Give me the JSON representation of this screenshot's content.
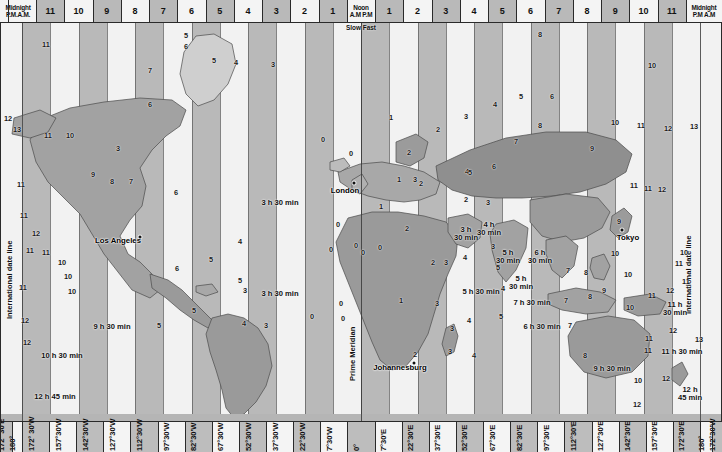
{
  "map": {
    "title": "World Time Zone Map",
    "width": 722,
    "height": 452,
    "colors": {
      "band_dark": "#b9b9b9",
      "band_light": "#f2f2f2",
      "land_dark": "#8f8f8f",
      "land_mid": "#a8a8a8",
      "land_light": "#cfcfcf",
      "ocean": "#e9e9e9",
      "ink": "#2a2a2a"
    }
  },
  "top_axis": {
    "label_left_l1": "Midnight",
    "label_left_l2": "P.M.A.M.",
    "label_center_l1": "Noon",
    "label_center_l2": "A.M P.M",
    "label_center_l3": "Slow Fast",
    "label_right_l1": "Midnight",
    "label_right_l2": "P.M A.M",
    "hours": [
      "11",
      "10",
      "9",
      "8",
      "7",
      "6",
      "5",
      "4",
      "3",
      "2",
      "1",
      "1",
      "2",
      "3",
      "4",
      "5",
      "6",
      "7",
      "8",
      "9",
      "10",
      "11"
    ]
  },
  "bottom_axis": {
    "longitudes": [
      "172° 30'E",
      "180°",
      "172° 30'W",
      "157°30'W",
      "142°30'W",
      "127°30'W",
      "112°30'W",
      "97°30'W",
      "82°30'W",
      "67°30'W",
      "52°30'W",
      "37°30'W",
      "22°30'W",
      "7°30'W",
      "0°",
      "7°30'E",
      "22°30'E",
      "37°30'E",
      "52°30'E",
      "67°30'E",
      "82°30'E",
      "97°30'E",
      "112°30'E",
      "127°30'E",
      "142°30'E",
      "157°30'E",
      "172°30'E",
      "180°",
      "172°30'W"
    ]
  },
  "vertical_labels": {
    "date_line_left": "International date line",
    "date_line_right": "International date line",
    "prime_meridian": "Prime Meridian"
  },
  "cities": [
    {
      "name": "Los Angeles",
      "x": 118,
      "y": 240,
      "dot_x": 140,
      "dot_y": 237
    },
    {
      "name": "London",
      "x": 345,
      "y": 190,
      "dot_x": 354,
      "dot_y": 183
    },
    {
      "name": "Tokyo",
      "x": 628,
      "y": 237,
      "dot_x": 622,
      "dot_y": 230
    },
    {
      "name": "Johannesburg",
      "x": 400,
      "y": 367,
      "dot_x": 414,
      "dot_y": 363
    }
  ],
  "half_hour_notes": [
    {
      "label": "3 h 30 min",
      "x": 280,
      "y": 203
    },
    {
      "label": "3 h 30 min",
      "x": 280,
      "y": 294
    },
    {
      "label": "3 h\n30 min",
      "x": 466,
      "y": 234
    },
    {
      "label": "4 h\n30 min",
      "x": 489,
      "y": 229
    },
    {
      "label": "5 h\n30 min",
      "x": 508,
      "y": 257
    },
    {
      "label": "6 h\n30 min",
      "x": 540,
      "y": 257
    },
    {
      "label": "5 h\n30 min",
      "x": 521,
      "y": 283
    },
    {
      "label": "5 h 30 min",
      "x": 481,
      "y": 292
    },
    {
      "label": "7 h 30 min",
      "x": 532,
      "y": 303
    },
    {
      "label": "6 h 30 min",
      "x": 542,
      "y": 327
    },
    {
      "label": "9 h 30 min",
      "x": 112,
      "y": 327
    },
    {
      "label": "10 h 30 min",
      "x": 62,
      "y": 356
    },
    {
      "label": "12 h 45 min",
      "x": 55,
      "y": 397
    },
    {
      "label": "9 h 30 min",
      "x": 612,
      "y": 369
    },
    {
      "label": "11 h 30 min",
      "x": 682,
      "y": 352
    },
    {
      "label": "11 h\n30 min",
      "x": 675,
      "y": 309
    },
    {
      "label": "12 h\n45 min",
      "x": 690,
      "y": 394
    }
  ],
  "zone_numbers": [
    {
      "t": "12",
      "x": 8,
      "y": 118
    },
    {
      "t": "13",
      "x": 17,
      "y": 129
    },
    {
      "t": "11",
      "x": 48,
      "y": 135
    },
    {
      "t": "10",
      "x": 70,
      "y": 135
    },
    {
      "t": "11",
      "x": 21,
      "y": 184
    },
    {
      "t": "9",
      "x": 93,
      "y": 174
    },
    {
      "t": "8",
      "x": 112,
      "y": 181
    },
    {
      "t": "7",
      "x": 131,
      "y": 181
    },
    {
      "t": "6",
      "x": 176,
      "y": 192
    },
    {
      "t": "7",
      "x": 150,
      "y": 70
    },
    {
      "t": "6",
      "x": 186,
      "y": 46
    },
    {
      "t": "5",
      "x": 214,
      "y": 60
    },
    {
      "t": "4",
      "x": 236,
      "y": 62
    },
    {
      "t": "3",
      "x": 273,
      "y": 64
    },
    {
      "t": "4",
      "x": 240,
      "y": 241
    },
    {
      "t": "5",
      "x": 211,
      "y": 259
    },
    {
      "t": "6",
      "x": 177,
      "y": 268
    },
    {
      "t": "5",
      "x": 240,
      "y": 280
    },
    {
      "t": "3",
      "x": 245,
      "y": 290
    },
    {
      "t": "4",
      "x": 244,
      "y": 323
    },
    {
      "t": "3",
      "x": 266,
      "y": 325
    },
    {
      "t": "5",
      "x": 194,
      "y": 310
    },
    {
      "t": "11",
      "x": 30,
      "y": 250
    },
    {
      "t": "11",
      "x": 46,
      "y": 252
    },
    {
      "t": "10",
      "x": 62,
      "y": 262
    },
    {
      "t": "10",
      "x": 68,
      "y": 276
    },
    {
      "t": "10",
      "x": 72,
      "y": 291
    },
    {
      "t": "11",
      "x": 23,
      "y": 287
    },
    {
      "t": "12",
      "x": 36,
      "y": 233
    },
    {
      "t": "12",
      "x": 27,
      "y": 342
    },
    {
      "t": "12",
      "x": 25,
      "y": 320
    },
    {
      "t": "11",
      "x": 24,
      "y": 215
    },
    {
      "t": "0",
      "x": 323,
      "y": 139
    },
    {
      "t": "0",
      "x": 351,
      "y": 153
    },
    {
      "t": "0",
      "x": 338,
      "y": 224
    },
    {
      "t": "0",
      "x": 356,
      "y": 245
    },
    {
      "t": "0",
      "x": 331,
      "y": 249
    },
    {
      "t": "0",
      "x": 363,
      "y": 252
    },
    {
      "t": "0",
      "x": 380,
      "y": 247
    },
    {
      "t": "0",
      "x": 341,
      "y": 303
    },
    {
      "t": "0",
      "x": 343,
      "y": 318
    },
    {
      "t": "1",
      "x": 399,
      "y": 179
    },
    {
      "t": "2",
      "x": 421,
      "y": 183
    },
    {
      "t": "3",
      "x": 415,
      "y": 179
    },
    {
      "t": "2",
      "x": 407,
      "y": 228
    },
    {
      "t": "2",
      "x": 466,
      "y": 199
    },
    {
      "t": "3",
      "x": 488,
      "y": 202
    },
    {
      "t": "4",
      "x": 467,
      "y": 171
    },
    {
      "t": "5",
      "x": 470,
      "y": 172
    },
    {
      "t": "6",
      "x": 494,
      "y": 166
    },
    {
      "t": "7",
      "x": 516,
      "y": 141
    },
    {
      "t": "8",
      "x": 540,
      "y": 125
    },
    {
      "t": "8",
      "x": 540,
      "y": 34
    },
    {
      "t": "9",
      "x": 592,
      "y": 148
    },
    {
      "t": "10",
      "x": 615,
      "y": 122
    },
    {
      "t": "11",
      "x": 641,
      "y": 125
    },
    {
      "t": "12",
      "x": 668,
      "y": 128
    },
    {
      "t": "13",
      "x": 694,
      "y": 126
    },
    {
      "t": "10",
      "x": 652,
      "y": 65
    },
    {
      "t": "11",
      "x": 46,
      "y": 44
    },
    {
      "t": "11",
      "x": 634,
      "y": 185
    },
    {
      "t": "11",
      "x": 648,
      "y": 188
    },
    {
      "t": "12",
      "x": 662,
      "y": 189
    },
    {
      "t": "9",
      "x": 619,
      "y": 221
    },
    {
      "t": "10",
      "x": 615,
      "y": 253
    },
    {
      "t": "10",
      "x": 628,
      "y": 274
    },
    {
      "t": "9",
      "x": 604,
      "y": 290
    },
    {
      "t": "10",
      "x": 630,
      "y": 307
    },
    {
      "t": "11",
      "x": 652,
      "y": 295
    },
    {
      "t": "12",
      "x": 670,
      "y": 290
    },
    {
      "t": "11",
      "x": 679,
      "y": 263
    },
    {
      "t": "10",
      "x": 684,
      "y": 252
    },
    {
      "t": "11",
      "x": 686,
      "y": 281
    },
    {
      "t": "12",
      "x": 673,
      "y": 330
    },
    {
      "t": "13",
      "x": 699,
      "y": 339
    },
    {
      "t": "11",
      "x": 649,
      "y": 338
    },
    {
      "t": "10",
      "x": 638,
      "y": 380
    },
    {
      "t": "12",
      "x": 666,
      "y": 378
    },
    {
      "t": "11",
      "x": 648,
      "y": 350
    },
    {
      "t": "12",
      "x": 637,
      "y": 404
    },
    {
      "t": "7",
      "x": 568,
      "y": 270
    },
    {
      "t": "8",
      "x": 586,
      "y": 272
    },
    {
      "t": "7",
      "x": 566,
      "y": 300
    },
    {
      "t": "8",
      "x": 590,
      "y": 296
    },
    {
      "t": "7",
      "x": 570,
      "y": 325
    },
    {
      "t": "8",
      "x": 585,
      "y": 355
    },
    {
      "t": "4",
      "x": 469,
      "y": 320
    },
    {
      "t": "3",
      "x": 452,
      "y": 328
    },
    {
      "t": "3",
      "x": 437,
      "y": 303
    },
    {
      "t": "3",
      "x": 450,
      "y": 351
    },
    {
      "t": "2",
      "x": 415,
      "y": 354
    },
    {
      "t": "1",
      "x": 401,
      "y": 300
    },
    {
      "t": "4",
      "x": 474,
      "y": 355
    },
    {
      "t": "2",
      "x": 433,
      "y": 262
    },
    {
      "t": "4",
      "x": 465,
      "y": 257
    },
    {
      "t": "3",
      "x": 446,
      "y": 262
    },
    {
      "t": "3",
      "x": 493,
      "y": 246
    },
    {
      "t": "4",
      "x": 503,
      "y": 288
    },
    {
      "t": "5",
      "x": 501,
      "y": 316
    },
    {
      "t": "1",
      "x": 381,
      "y": 206
    },
    {
      "t": "5",
      "x": 498,
      "y": 267
    },
    {
      "t": "1",
      "x": 391,
      "y": 117
    },
    {
      "t": "2",
      "x": 438,
      "y": 129
    },
    {
      "t": "3",
      "x": 466,
      "y": 116
    },
    {
      "t": "4",
      "x": 495,
      "y": 104
    },
    {
      "t": "5",
      "x": 521,
      "y": 96
    },
    {
      "t": "6",
      "x": 552,
      "y": 96
    },
    {
      "t": "2",
      "x": 409,
      "y": 152
    },
    {
      "t": "0",
      "x": 312,
      "y": 316
    },
    {
      "t": "5",
      "x": 159,
      "y": 325
    },
    {
      "t": "6",
      "x": 150,
      "y": 104
    },
    {
      "t": "5",
      "x": 186,
      "y": 35
    },
    {
      "t": "3",
      "x": 118,
      "y": 148
    }
  ]
}
